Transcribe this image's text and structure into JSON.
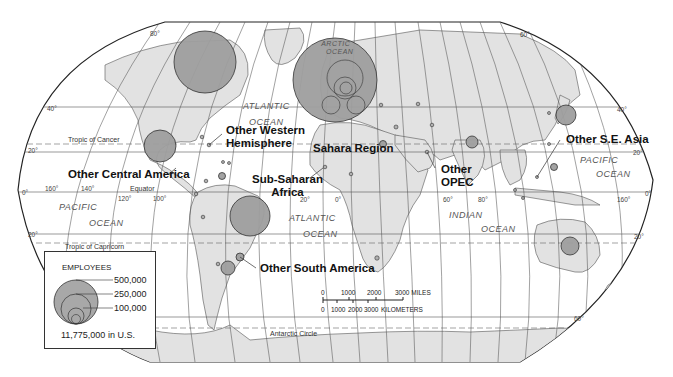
{
  "map": {
    "title_visible": false,
    "colors": {
      "land": "#e2e2e2",
      "bubble": "#9e9e9e",
      "border": "#333333",
      "ocean": "#ffffff"
    },
    "oceans": [
      {
        "name": "arctic",
        "line1": "ARCTIC",
        "line2": "OCEAN"
      },
      {
        "name": "atlantic-north",
        "line1": "ATLANTIC",
        "line2": "OCEAN"
      },
      {
        "name": "atlantic-south",
        "line1": "ATLANTIC",
        "line2": "OCEAN"
      },
      {
        "name": "pacific-east",
        "line1": "PACIFIC",
        "line2": "OCEAN"
      },
      {
        "name": "pacific-west",
        "line1": "PACIFIC",
        "line2": "OCEAN"
      },
      {
        "name": "indian",
        "line1": "INDIAN",
        "line2": "OCEAN"
      }
    ],
    "reference_lines": {
      "tropic_cancer": "Tropic of Cancer",
      "tropic_capricorn": "Tropic of Capricorn",
      "equator": "Equator",
      "antarctic_circle": "Antarctic Circle"
    },
    "ticks": {
      "lat_80": "80°",
      "lat_40": "40°",
      "lat_20": "20°",
      "lat_0": "0°",
      "lat_m20": "20°",
      "lat_m60": "60°",
      "lon_160w": "160°",
      "lon_140w": "140°",
      "lon_120w": "120°",
      "lon_100w": "100°",
      "lon_20": "20°",
      "lon_0": "0°",
      "lon_60": "60°",
      "lon_80": "80°",
      "lon_160e": "160°",
      "r_lat_60": "60°",
      "r_lat_40": "40°",
      "r_lat_20": "20°",
      "r_lat_0": "0°",
      "r_lat_m20": "20°",
      "r_lat_m60": "60°"
    },
    "regions": [
      {
        "label": "Other Western\nHemisphere",
        "line1": "Other Western",
        "line2": "Hemisphere"
      },
      {
        "label": "Other Central America"
      },
      {
        "label": "Sahara Region"
      },
      {
        "label": "Sub-Saharan Africa",
        "line1": "Sub-Saharan",
        "line2": "Africa"
      },
      {
        "label": "Other OPEC",
        "line1": "Other",
        "line2": "OPEC"
      },
      {
        "label": "Other S.E. Asia"
      },
      {
        "label": "Other South America"
      }
    ]
  },
  "legend": {
    "title": "EMPLOYEES",
    "values": [
      "500,000",
      "250,000",
      "100,000"
    ],
    "us_note": "11,775,000 in U.S."
  },
  "scale_bar": {
    "miles": [
      "0",
      "1000",
      "2000",
      "3000 MILES"
    ],
    "km": [
      "0",
      "1000",
      "2000",
      "3000",
      "KILOMETERS"
    ]
  }
}
